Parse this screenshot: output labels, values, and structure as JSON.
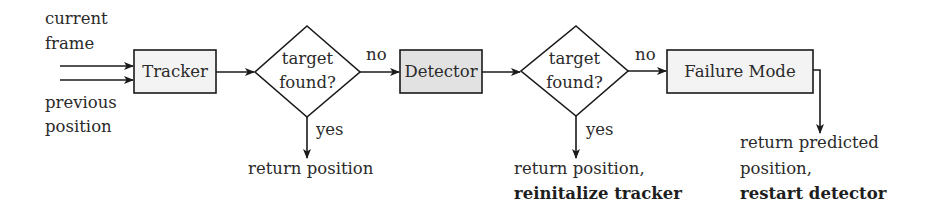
{
  "diagram": {
    "type": "flowchart",
    "colors": {
      "stroke": "#1a1a1a",
      "box_fill_light": "#f3f3f3",
      "box_fill_dark": "#e2e2e2",
      "text": "#2a2a2a"
    },
    "inputs": {
      "top_label_line1": "current",
      "top_label_line2": "frame",
      "bottom_label_line1": "previous",
      "bottom_label_line2": "position"
    },
    "nodes": {
      "tracker": {
        "label": "Tracker",
        "shape": "rect"
      },
      "decision1": {
        "label_line1": "target",
        "label_line2": "found?",
        "shape": "diamond"
      },
      "detector": {
        "label": "Detector",
        "shape": "rect"
      },
      "decision2": {
        "label_line1": "target",
        "label_line2": "found?",
        "shape": "diamond"
      },
      "failure_mode": {
        "label": "Failure Mode",
        "shape": "rect"
      }
    },
    "edges": {
      "d1_no": "no",
      "d1_yes": "yes",
      "d2_no": "no",
      "d2_yes": "yes"
    },
    "outputs": {
      "out1": {
        "line1": "return position"
      },
      "out2": {
        "line1": "return position,",
        "line2_bold": "reinitalize tracker"
      },
      "out3": {
        "line1": "return predicted",
        "line2": "position,",
        "line3_bold": "restart detector"
      }
    }
  }
}
